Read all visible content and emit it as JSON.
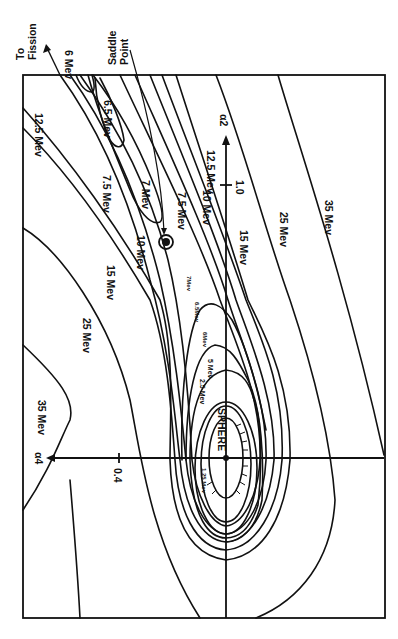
{
  "figure": {
    "axes": {
      "alpha2": {
        "label": "α2",
        "tick_value": "1.0"
      },
      "alpha4": {
        "label": "α4",
        "tick_value": "0.4"
      }
    },
    "annotations": {
      "to_fission": "To Fission",
      "to_fission_line1": "To",
      "to_fission_line2": "Fission",
      "saddle_point": "Saddle Point",
      "saddle_line1": "Saddle",
      "saddle_line2": "Point",
      "sphere": "SPHERE"
    },
    "contour_labels": {
      "mev_6": "6 Mev",
      "mev_6_5_top": "6.5 Mev",
      "mev_7_top": "7 Mev",
      "mev_7_5_left": "7.5 Mev",
      "mev_7_5_right": "7.5 Mev",
      "mev_10_left": "10 Mev",
      "mev_10_right": "10 Mev",
      "mev_12_5_left": "12.5 Mev",
      "mev_12_5_right": "12.5 Mev",
      "mev_15_left": "15 Mev",
      "mev_15_right": "15 Mev",
      "mev_25_left": "25 Mev",
      "mev_25_right": "25 Mev",
      "mev_35_left": "35 Mev",
      "mev_35_right": "35 Mev",
      "mev_7_inner": "7Mev",
      "mev_6_5_inner": "6.5Mev",
      "mev_6_inner": "6Mev",
      "mev_5": "5 Mev",
      "mev_2_5": "2.5 Mev",
      "mev_1_25": "1.25 Mev"
    },
    "contour_levels_mev": [
      1.25,
      2.5,
      5,
      6,
      6.5,
      7,
      7.5,
      10,
      12.5,
      15,
      25,
      35
    ]
  }
}
